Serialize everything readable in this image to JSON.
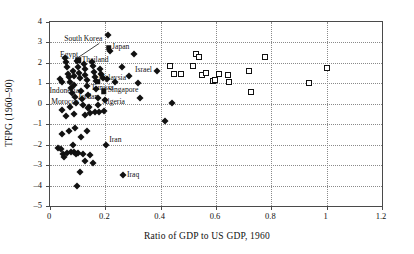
{
  "chart_data": {
    "type": "scatter",
    "title": "",
    "xlabel": "Ratio of GDP to US GDP, 1960",
    "ylabel": "TFPG (1960–90)",
    "xlim": [
      0,
      1.2
    ],
    "ylim": [
      -5,
      4
    ],
    "xticks": [
      "0",
      "0.2",
      "0.4",
      "0.6",
      "0.8",
      "1",
      "1.2"
    ],
    "xtick_values": [
      0,
      0.2,
      0.4,
      0.6,
      0.8,
      1.0,
      1.2
    ],
    "yticks": [
      "4",
      "3",
      "2",
      "1",
      "0",
      "–1",
      "–2",
      "–3",
      "–4",
      "–5"
    ],
    "ytick_values": [
      4,
      3,
      2,
      1,
      0,
      -1,
      -2,
      -3,
      -4,
      -5
    ],
    "grid": "both-dotted",
    "legend": "none",
    "series": [
      {
        "name": "developing economies",
        "marker": "filled-diamond",
        "points": [
          [
            0.035,
            1.22
          ],
          [
            0.045,
            1.08
          ],
          [
            0.055,
            2.22
          ],
          [
            0.058,
            2.02
          ],
          [
            0.062,
            1.78
          ],
          [
            0.065,
            1.45
          ],
          [
            0.068,
            1.33
          ],
          [
            0.072,
            1.05
          ],
          [
            0.075,
            0.78
          ],
          [
            0.078,
            0.52
          ],
          [
            0.082,
            1.62
          ],
          [
            0.085,
            1.38
          ],
          [
            0.088,
            0.92
          ],
          [
            0.092,
            0.35
          ],
          [
            0.095,
            0.05
          ],
          [
            0.098,
            2.08
          ],
          [
            0.102,
            1.82
          ],
          [
            0.105,
            1.52
          ],
          [
            0.108,
            1.28
          ],
          [
            0.112,
            0.62
          ],
          [
            0.115,
            0.22
          ],
          [
            0.118,
            -0.05
          ],
          [
            0.122,
            1.95
          ],
          [
            0.125,
            1.72
          ],
          [
            0.128,
            1.42
          ],
          [
            0.132,
            1.18
          ],
          [
            0.135,
            0.88
          ],
          [
            0.138,
            0.42
          ],
          [
            0.142,
            -0.18
          ],
          [
            0.145,
            -0.45
          ],
          [
            0.152,
            2.05
          ],
          [
            0.155,
            1.85
          ],
          [
            0.158,
            1.55
          ],
          [
            0.162,
            1.32
          ],
          [
            0.165,
            1.12
          ],
          [
            0.168,
            0.72
          ],
          [
            0.172,
            0.28
          ],
          [
            0.175,
            -0.08
          ],
          [
            0.178,
            -0.38
          ],
          [
            0.182,
            1.68
          ],
          [
            0.185,
            1.45
          ],
          [
            0.192,
            1.25
          ],
          [
            0.198,
            0.18
          ],
          [
            0.205,
            1.22
          ],
          [
            0.21,
            3.35
          ],
          [
            0.218,
            2.58
          ],
          [
            0.235,
            1.05
          ],
          [
            0.262,
            1.78
          ],
          [
            0.285,
            1.35
          ],
          [
            0.305,
            2.42
          ],
          [
            0.318,
            1.02
          ],
          [
            0.325,
            0.28
          ],
          [
            0.385,
            1.62
          ],
          [
            0.415,
            -0.82
          ],
          [
            0.44,
            0.05
          ],
          [
            0.028,
            -2.18
          ],
          [
            0.038,
            -2.22
          ],
          [
            0.042,
            -1.48
          ],
          [
            0.048,
            -2.45
          ],
          [
            0.052,
            -2.58
          ],
          [
            0.062,
            -2.42
          ],
          [
            0.068,
            -1.32
          ],
          [
            0.075,
            -2.38
          ],
          [
            0.082,
            -2.02
          ],
          [
            0.088,
            -2.35
          ],
          [
            0.092,
            -1.18
          ],
          [
            0.095,
            -2.48
          ],
          [
            0.098,
            -4.02
          ],
          [
            0.102,
            -2.42
          ],
          [
            0.108,
            -3.32
          ],
          [
            0.112,
            -1.62
          ],
          [
            0.118,
            -2.45
          ],
          [
            0.125,
            -2.78
          ],
          [
            0.132,
            -1.35
          ],
          [
            0.145,
            -2.52
          ],
          [
            0.155,
            -2.88
          ],
          [
            0.162,
            -0.42
          ],
          [
            0.045,
            -0.32
          ],
          [
            0.058,
            -0.62
          ],
          [
            0.072,
            -0.18
          ],
          [
            0.085,
            -0.52
          ],
          [
            0.128,
            -0.55
          ],
          [
            0.138,
            -0.22
          ],
          [
            0.195,
            -0.35
          ],
          [
            0.202,
            -2.02
          ],
          [
            0.265,
            -3.48
          ]
        ]
      },
      {
        "name": "newly industrialized / high performers",
        "marker": "filled-square",
        "points": [
          [
            0.102,
            2.12
          ],
          [
            0.172,
            1.08
          ],
          [
            0.195,
            0.62
          ],
          [
            0.212,
            2.75
          ]
        ]
      },
      {
        "name": "industrial economies",
        "marker": "open-square",
        "points": [
          [
            0.435,
            1.85
          ],
          [
            0.448,
            1.48
          ],
          [
            0.472,
            1.48
          ],
          [
            0.518,
            1.85
          ],
          [
            0.528,
            2.42
          ],
          [
            0.538,
            2.28
          ],
          [
            0.548,
            1.42
          ],
          [
            0.565,
            1.52
          ],
          [
            0.588,
            1.12
          ],
          [
            0.598,
            1.18
          ],
          [
            0.612,
            1.48
          ],
          [
            0.642,
            1.42
          ],
          [
            0.648,
            1.08
          ],
          [
            0.718,
            1.62
          ],
          [
            0.725,
            0.58
          ],
          [
            0.778,
            2.28
          ],
          [
            0.935,
            1.02
          ],
          [
            1.002,
            1.75
          ]
        ]
      }
    ],
    "annotations": [
      {
        "text": "South Korea",
        "x": 0.102,
        "y": 2.12,
        "lx": 0.055,
        "ly": 3.1,
        "align": "left",
        "leader": true
      },
      {
        "text": "Egypt",
        "x": 0.102,
        "y": 2.12,
        "lx": 0.04,
        "ly": 2.35,
        "align": "left",
        "leader": false
      },
      {
        "text": "Thailand",
        "x": 0.102,
        "y": 2.12,
        "lx": 0.118,
        "ly": 2.1,
        "align": "left",
        "leader": false
      },
      {
        "text": "Japan",
        "x": 0.212,
        "y": 2.75,
        "lx": 0.228,
        "ly": 2.75,
        "align": "left",
        "leader": false
      },
      {
        "text": "Malaysia",
        "x": 0.172,
        "y": 1.08,
        "lx": 0.178,
        "ly": 1.22,
        "align": "left",
        "leader": false
      },
      {
        "text": "Israel",
        "x": 0.385,
        "y": 1.62,
        "lx": 0.372,
        "ly": 1.62,
        "align": "right",
        "leader": false
      },
      {
        "text": "Singapore",
        "x": 0.195,
        "y": 0.62,
        "lx": 0.212,
        "ly": 0.62,
        "align": "left",
        "leader": false
      },
      {
        "text": "Tunisia",
        "x": 0.165,
        "y": 0.7,
        "lx": 0.152,
        "ly": 0.72,
        "align": "left",
        "leader": false
      },
      {
        "text": "Indonesia",
        "x": 0.055,
        "y": 0.62,
        "lx": 0.002,
        "ly": 0.58,
        "align": "left",
        "leader": false
      },
      {
        "text": "Jordan",
        "x": 0.122,
        "y": 0.28,
        "lx": 0.105,
        "ly": 0.3,
        "align": "left",
        "leader": false
      },
      {
        "text": "Morocco",
        "x": 0.048,
        "y": 0.02,
        "lx": 0.008,
        "ly": 0.02,
        "align": "left",
        "leader": false
      },
      {
        "text": "Algeria",
        "x": 0.178,
        "y": 0.02,
        "lx": 0.192,
        "ly": 0.02,
        "align": "left",
        "leader": false
      },
      {
        "text": "Iran",
        "x": 0.202,
        "y": -2.02,
        "lx": 0.218,
        "ly": -1.82,
        "align": "left",
        "leader": false
      },
      {
        "text": "Iraq",
        "x": 0.265,
        "y": -3.48,
        "lx": 0.282,
        "ly": -3.55,
        "align": "left",
        "leader": false
      }
    ]
  }
}
